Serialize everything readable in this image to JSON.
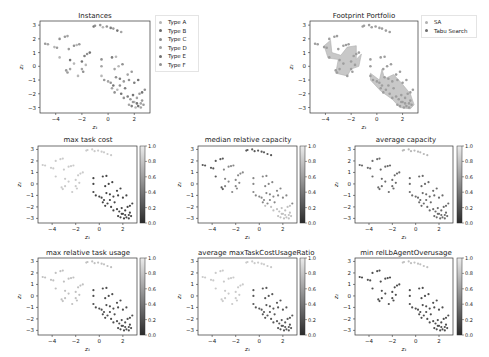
{
  "figure": {
    "panels": [
      {
        "id": "instances",
        "title": "Instances",
        "xlabel": "z1",
        "ylabel": "z2"
      },
      {
        "id": "footprint",
        "title": "Footprint Portfolio",
        "xlabel": "z1",
        "ylabel": "z2"
      },
      {
        "id": "max_task_cost",
        "title": "max task cost",
        "xlabel": "z1",
        "ylabel": "z2"
      },
      {
        "id": "median_relative_capacity",
        "title": "median relative capacity",
        "xlabel": "z1",
        "ylabel": "z2"
      },
      {
        "id": "average_capacity",
        "title": "average capacity",
        "xlabel": "z1",
        "ylabel": "z2"
      },
      {
        "id": "max_relative_task_usage",
        "title": "max relative task usage",
        "xlabel": "z1",
        "ylabel": "z2"
      },
      {
        "id": "average_maxTaskCostUsageRatio",
        "title": "average maxTaskCostUsageRatio",
        "xlabel": "z1",
        "ylabel": "z2"
      },
      {
        "id": "min_relLbAgentOverusage",
        "title": "min relLbAgentOverusage",
        "xlabel": "z1",
        "ylabel": "z2"
      }
    ],
    "instances_legend": [
      "Type A",
      "Type B",
      "Type C",
      "Type D",
      "Type E",
      "Type F"
    ],
    "footprint_legend": [
      "SA",
      "Tabu Search"
    ],
    "colorbar_ticks": [
      "1.0",
      "0.8",
      "0.6",
      "0.4",
      "0.2",
      "0.0"
    ],
    "x_ticks": [
      "-4",
      "-2",
      "0",
      "2"
    ],
    "y_ticks": [
      "3",
      "2",
      "1",
      "0",
      "-1",
      "-2",
      "-3"
    ]
  },
  "chart_data": [
    {
      "type": "scatter",
      "title": "Instances",
      "xlabel": "z1",
      "ylabel": "z2",
      "xlim": [
        -5.2,
        3.2
      ],
      "ylim": [
        -3.4,
        3.3
      ],
      "legend": [
        "Type A",
        "Type B",
        "Type C",
        "Type D",
        "Type E",
        "Type F"
      ],
      "note": "Points arranged along diagonal band from (-5,1.7) to (3,-3) plus an upper arc near (-1,3) to (1,2.4)"
    },
    {
      "type": "scatter",
      "title": "Footprint Portfolio",
      "xlabel": "z1",
      "ylabel": "z2",
      "xlim": [
        -5.2,
        3.2
      ],
      "ylim": [
        -3.4,
        3.3
      ],
      "legend": [
        "SA",
        "Tabu Search"
      ],
      "note": "Shaded footprint regions: upper-left cluster (-4,1.5)..(-2,-0.7) and lower-right cluster (-0.5,-0.7)..(2.8,-3)"
    },
    {
      "type": "scatter",
      "title": "max task cost",
      "colorbar": [
        0.0,
        1.0
      ],
      "note": "Dark (high) values in lower-right cluster, light elsewhere"
    },
    {
      "type": "scatter",
      "title": "median relative capacity",
      "colorbar": [
        0.0,
        1.0
      ],
      "note": "Dark values at top arc and upper-left, light in lower-right bottom"
    },
    {
      "type": "scatter",
      "title": "average capacity",
      "colorbar": [
        0.0,
        1.0
      ],
      "note": "Mostly dark/mid grey across points, lighter at top arc"
    },
    {
      "type": "scatter",
      "title": "max relative task usage",
      "colorbar": [
        0.0,
        1.0
      ],
      "note": "Dark in lower-right cluster, light in upper-left"
    },
    {
      "type": "scatter",
      "title": "average maxTaskCostUsageRatio",
      "colorbar": [
        0.0,
        1.0
      ],
      "note": "Dark in lower-right cluster, light in upper-left and top arc"
    },
    {
      "type": "scatter",
      "title": "min relLbAgentOverusage",
      "colorbar": [
        0.0,
        1.0
      ],
      "note": "Dark points throughout, light at top arc"
    }
  ]
}
